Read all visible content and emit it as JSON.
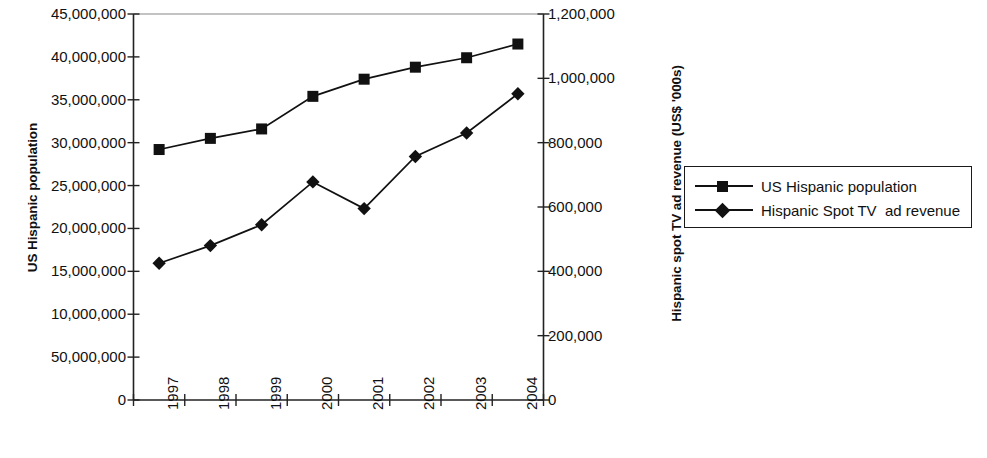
{
  "chart_data": {
    "type": "line",
    "title": "",
    "subtitle": "",
    "xlabel": "",
    "categories": [
      "1997",
      "1998",
      "1999",
      "2000",
      "2001",
      "2002",
      "2003",
      "2004"
    ],
    "grid": false,
    "legend_position": "right",
    "axes": {
      "left": {
        "label": "US Hispanic population",
        "min": 0,
        "max": 45000000,
        "step": 5000000,
        "tick_labels": [
          "45,000,000",
          "40,000,000",
          "35,000,000",
          "30,000,000",
          "25,000,000",
          "20,000,000",
          "15,000,000",
          "10,000,000",
          "50,000,000",
          "0"
        ],
        "tick_values": [
          45000000,
          40000000,
          35000000,
          30000000,
          25000000,
          20000000,
          15000000,
          10000000,
          5000000,
          0
        ]
      },
      "right": {
        "label": "Hispanic spot TV ad revenue (US$ '000s)",
        "min": 0,
        "max": 1200000,
        "step": 200000,
        "tick_labels": [
          "1,200,000",
          "1,000,000",
          "800,000",
          "600,000",
          "400,000",
          "200,000",
          "0"
        ],
        "tick_values": [
          1200000,
          1000000,
          800000,
          600000,
          400000,
          200000,
          0
        ]
      }
    },
    "series": [
      {
        "name": "US Hispanic population",
        "axis": "left",
        "marker": "square",
        "color": "#111111",
        "values": [
          29200000,
          30500000,
          31600000,
          35400000,
          37400000,
          38800000,
          39900000,
          41500000
        ]
      },
      {
        "name": "Hispanic Spot TV  ad revenue",
        "axis": "right",
        "marker": "diamond",
        "color": "#111111",
        "values": [
          425000,
          480000,
          545000,
          678000,
          595000,
          757000,
          830000,
          952000
        ]
      }
    ]
  },
  "legend": {
    "entries": [
      {
        "label": "US Hispanic population",
        "marker": "square"
      },
      {
        "label": "Hispanic Spot TV  ad revenue",
        "marker": "diamond"
      }
    ]
  }
}
